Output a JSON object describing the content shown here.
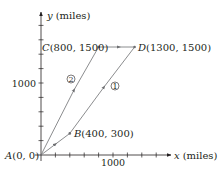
{
  "diagram": {
    "type": "coordinate-path-diagram",
    "colors": {
      "axis": "#231f20",
      "path": "#6d6e71",
      "text": "#231f20"
    },
    "axes": {
      "x": {
        "var": "x",
        "unit": "(miles)",
        "tick_label": "1000",
        "tick_step": 200,
        "max": 1500
      },
      "y": {
        "var": "y",
        "unit": "(miles)",
        "tick_label": "1000",
        "tick_step": 200,
        "max": 1700
      }
    },
    "points": [
      {
        "id": "A",
        "letter": "A",
        "coords": "(0, 0)",
        "x": 0,
        "y": 0
      },
      {
        "id": "B",
        "letter": "B",
        "coords": "(400, 300)",
        "x": 400,
        "y": 300
      },
      {
        "id": "C",
        "letter": "C",
        "coords": "(800, 1500)",
        "x": 800,
        "y": 1500
      },
      {
        "id": "D",
        "letter": "D",
        "coords": "(1300, 1500)",
        "x": 1300,
        "y": 1500
      }
    ],
    "routes": [
      {
        "id": "route-1",
        "marker": "①",
        "path": [
          "A",
          "B",
          "D"
        ]
      },
      {
        "id": "route-2",
        "marker": "②",
        "path": [
          "A",
          "C",
          "D"
        ]
      }
    ]
  }
}
